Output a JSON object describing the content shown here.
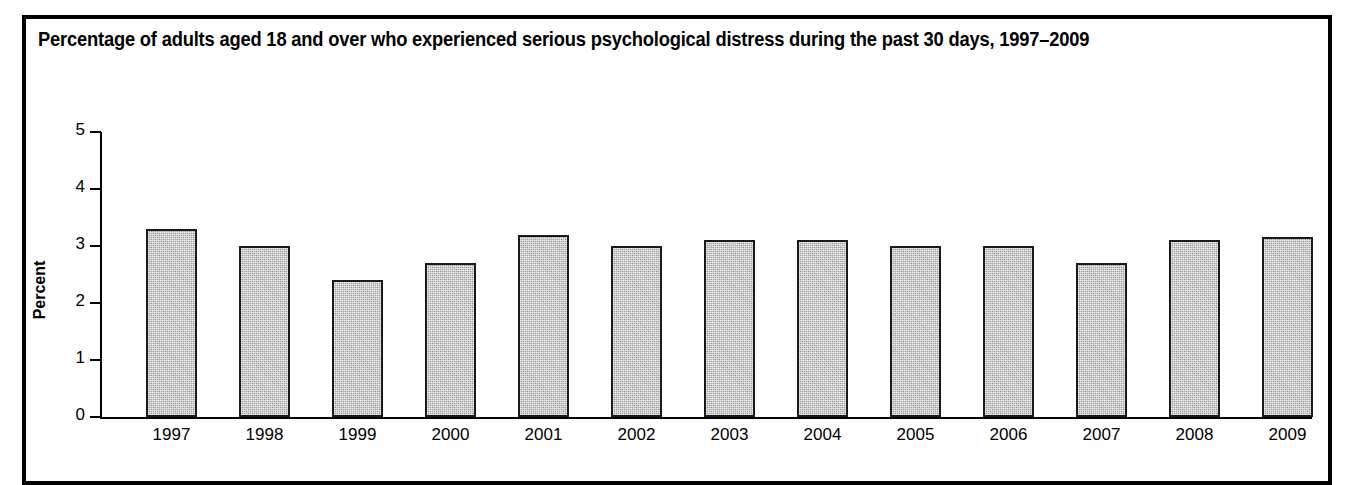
{
  "chart_data": {
    "type": "bar",
    "title": "Percentage of adults aged 18 and over who experienced serious psychological distress during the past 30 days, 1997–2009",
    "xlabel": "",
    "ylabel": "Percent",
    "categories": [
      "1997",
      "1998",
      "1999",
      "2000",
      "2001",
      "2002",
      "2003",
      "2004",
      "2005",
      "2006",
      "2007",
      "2008",
      "2009"
    ],
    "values": [
      3.3,
      3.0,
      2.4,
      2.7,
      3.2,
      3.0,
      3.1,
      3.1,
      3.0,
      3.0,
      2.7,
      3.1,
      3.15
    ],
    "ylim": [
      0,
      5
    ],
    "ytick_labels": [
      "5",
      "4",
      "3",
      "2",
      "1",
      "0"
    ],
    "ytick_values": [
      5,
      4,
      3,
      2,
      1,
      0
    ],
    "grid": false,
    "legend": null,
    "bar_fill_color": "#a9a9a9",
    "bar_edge_color": "#1a1a1a",
    "frame_color": "#000000",
    "background_color": "#ffffff"
  }
}
